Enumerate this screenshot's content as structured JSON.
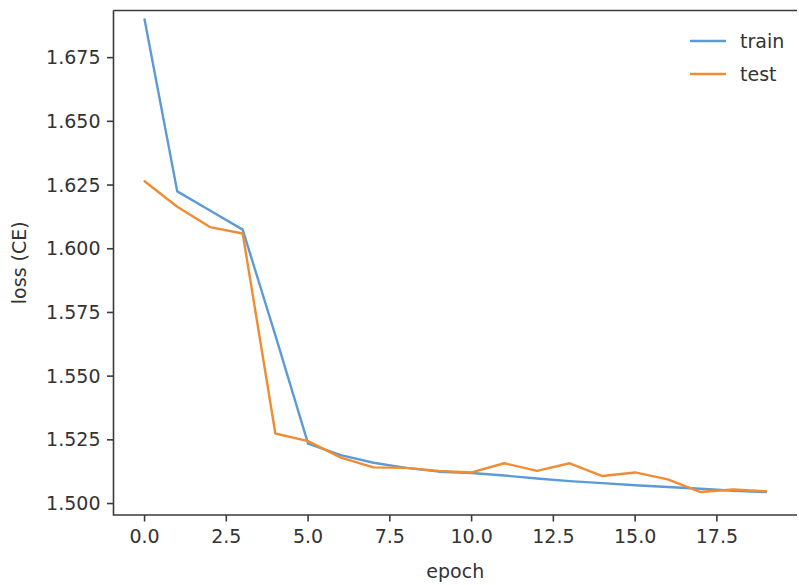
{
  "chart_data": {
    "type": "line",
    "title": "",
    "xlabel": "epoch",
    "ylabel": "loss (CE)",
    "xlim": [
      -0.95,
      19.95
    ],
    "ylim": [
      1.4955,
      1.6935
    ],
    "grid": false,
    "legend_position": "upper right",
    "xticks": [
      0.0,
      2.5,
      5.0,
      7.5,
      10.0,
      12.5,
      15.0,
      17.5
    ],
    "xtick_labels": [
      "0.0",
      "2.5",
      "5.0",
      "7.5",
      "10.0",
      "12.5",
      "15.0",
      "17.5"
    ],
    "yticks": [
      1.5,
      1.525,
      1.55,
      1.575,
      1.6,
      1.625,
      1.65,
      1.675
    ],
    "ytick_labels": [
      "1.500",
      "1.525",
      "1.550",
      "1.575",
      "1.600",
      "1.625",
      "1.650",
      "1.675"
    ],
    "x": [
      0,
      1,
      2,
      3,
      4,
      5,
      6,
      7,
      8,
      9,
      10,
      11,
      12,
      13,
      14,
      15,
      16,
      17,
      18,
      19
    ],
    "series": [
      {
        "name": "train",
        "color": "#5c9bd6",
        "values": [
          1.69,
          1.6225,
          1.615,
          1.6075,
          1.566,
          1.5235,
          1.519,
          1.516,
          1.514,
          1.5125,
          1.512,
          1.511,
          1.5098,
          1.5088,
          1.508,
          1.5072,
          1.5065,
          1.5058,
          1.505,
          1.5045
        ]
      },
      {
        "name": "test",
        "color": "#f08c32",
        "values": [
          1.6265,
          1.6165,
          1.6085,
          1.606,
          1.5275,
          1.5245,
          1.518,
          1.5142,
          1.514,
          1.5128,
          1.5122,
          1.5158,
          1.5128,
          1.5158,
          1.5108,
          1.5122,
          1.5095,
          1.5045,
          1.5055,
          1.5048
        ]
      }
    ]
  },
  "legend": {
    "entries": [
      {
        "label": "train",
        "color": "#5c9bd6"
      },
      {
        "label": "test",
        "color": "#f08c32"
      }
    ]
  },
  "axes": {
    "x_axis_title": "epoch",
    "y_axis_title": "loss (CE)"
  }
}
